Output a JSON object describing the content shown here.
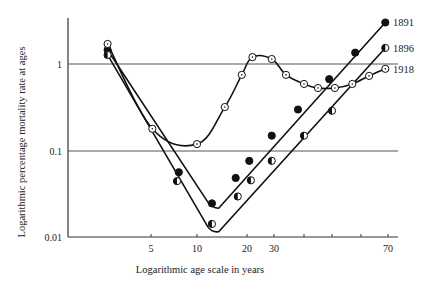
{
  "chart_data": {
    "type": "line",
    "title": "",
    "xlabel": "Logarithmic age scale in years",
    "ylabel": "Logarithmic percentage mortality rate at ages",
    "x_scale": "log",
    "y_scale": "log",
    "xlim": [
      2.5,
      75
    ],
    "ylim": [
      0.01,
      5
    ],
    "x_ticks": [
      5,
      10,
      20,
      30,
      40,
      50,
      60,
      70
    ],
    "x_tick_labels": [
      "5",
      "10",
      "20",
      "30",
      "",
      "",
      "",
      "70"
    ],
    "y_ticks": [
      0.01,
      0.1,
      1
    ],
    "y_tick_labels": [
      "0.01",
      "0.1",
      "1"
    ],
    "gridlines": "horizontal at 0.1 and 1",
    "legend": "direct labels at line ends (right)",
    "series": [
      {
        "name": "1891",
        "marker": "filled-circle",
        "x": [
          2.6,
          7.6,
          12.3,
          17.1,
          20.7,
          29,
          38,
          49,
          58,
          69
        ],
        "values": [
          1.45,
          0.057,
          0.025,
          0.049,
          0.077,
          0.15,
          0.3,
          0.67,
          1.35,
          3.0
        ]
      },
      {
        "name": "1896",
        "marker": "half-filled-circle",
        "x": [
          2.6,
          7.4,
          12.3,
          17.6,
          21.2,
          29,
          40,
          50,
          69
        ],
        "values": [
          1.27,
          0.045,
          0.0145,
          0.03,
          0.046,
          0.077,
          0.15,
          0.29,
          1.53
        ]
      },
      {
        "name": "1918",
        "marker": "open-circle",
        "x": [
          2.6,
          5.1,
          10,
          14.7,
          18.6,
          21.7,
          29,
          34,
          40,
          45,
          51,
          57,
          63,
          69
        ],
        "values": [
          1.7,
          0.18,
          0.12,
          0.32,
          0.75,
          1.2,
          1.14,
          0.75,
          0.59,
          0.53,
          0.53,
          0.59,
          0.73,
          0.88
        ]
      }
    ]
  },
  "labels": {
    "ylabel": "Logarithmic percentage mortality rate at ages",
    "xlabel": "Logarithmic age scale in years",
    "series_1891": "1891",
    "series_1896": "1896",
    "series_1918": "1918",
    "y_tick_1": "1",
    "y_tick_01": "0.1",
    "y_tick_001": "0.01",
    "x_tick_5": "5",
    "x_tick_10": "10",
    "x_tick_20": "20",
    "x_tick_30": "30",
    "x_tick_70": "70"
  }
}
